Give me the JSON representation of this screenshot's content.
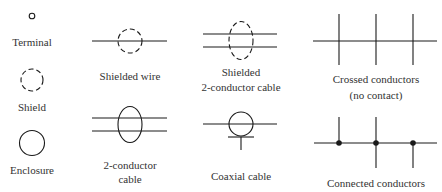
{
  "stroke_color": "#1a1a1a",
  "symbols": {
    "terminal": {
      "label": "Terminal"
    },
    "shield": {
      "label": "Shield"
    },
    "enclosure": {
      "label": "Enclosure"
    },
    "shielded_wire": {
      "label": "Shielded wire"
    },
    "two_conductor_cable": {
      "label_line1": "2-conductor",
      "label_line2": "cable"
    },
    "shielded_two_conductor_cable": {
      "label_line1": "Shielded",
      "label_line2": "2-conductor cable"
    },
    "coaxial_cable": {
      "label": "Coaxial cable"
    },
    "crossed_conductors": {
      "label_line1": "Crossed conductors",
      "label_line2": "(no contact)"
    },
    "connected_conductors": {
      "label": "Connected conductors"
    }
  }
}
